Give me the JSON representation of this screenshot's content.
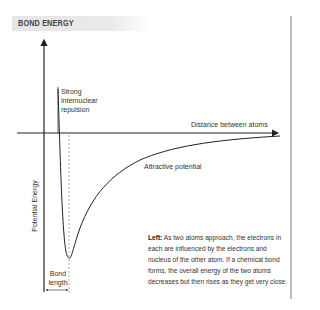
{
  "header": {
    "title": "BOND ENERGY"
  },
  "diagram": {
    "y_axis_label": "Potential Energy",
    "x_axis_label": "Distance between atoms",
    "repulsion_label": "Strong internuclear repulsion",
    "repulsion_lines": [
      "Strong",
      "internuclear",
      "repulsion"
    ],
    "attractive_label": "Attractive potential",
    "bond_length_lines": [
      "Bond",
      "length"
    ]
  },
  "caption": {
    "lead": "Left:",
    "text": " As two atoms approach, the electrons in each are influenced by the electrons and nucleus of the other atom. If a chemical bond forms, the overall energy of the two atoms decreases but then rises as they get very close."
  },
  "colors": {
    "header_bg": "#e6e6e6",
    "line": "#222222",
    "rule": "#bdbdbd"
  }
}
